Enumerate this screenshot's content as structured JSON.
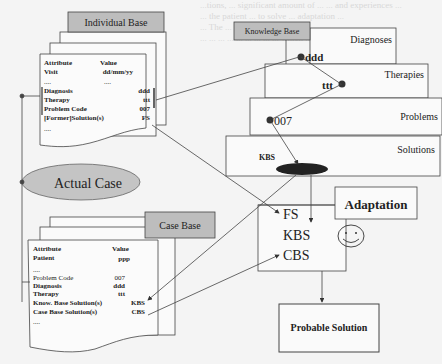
{
  "individual_base": {
    "title": "Individual Base",
    "header": {
      "attribute": "Attribute",
      "value": "Value"
    },
    "rows": [
      {
        "attribute": "Visit",
        "value": "dd/mm/yy"
      },
      {
        "attribute": "....",
        "value": "...."
      },
      {
        "attribute": "Diagnosis",
        "value": "ddd"
      },
      {
        "attribute": "Therapy",
        "value": "ttt"
      },
      {
        "attribute": "Problem Code",
        "value": "007"
      },
      {
        "attribute": "[Former]Solution(s)",
        "value": "FS"
      },
      {
        "attribute": "....",
        "value": ""
      }
    ]
  },
  "knowledge_base": {
    "title": "Knowledge Base",
    "levels": [
      "Diagnoses",
      "Therapies",
      "Problems",
      "Solutions"
    ],
    "nodes": {
      "diagnosis": "ddd",
      "therapy": "ttt",
      "problem": "007",
      "solution": "KBS"
    }
  },
  "actual_case": {
    "label": "Actual Case"
  },
  "case_base": {
    "title": "Case Base",
    "header": {
      "attribute": "Attribute",
      "value": "Value"
    },
    "rows": [
      {
        "attribute": "Patient",
        "value": "ppp"
      },
      {
        "attribute": "....",
        "value": ""
      },
      {
        "attribute": "Problem Code",
        "value": "007"
      },
      {
        "attribute": "Diagnosis",
        "value": "ddd"
      },
      {
        "attribute": "Therapy",
        "value": "ttt"
      },
      {
        "attribute": "Know. Base Solution(s)",
        "value": "KBS"
      },
      {
        "attribute": "Case Base Solution(s)",
        "value": "CBS"
      },
      {
        "attribute": "....",
        "value": ""
      }
    ]
  },
  "solutions_box": {
    "items": [
      "FS",
      "KBS",
      "CBS"
    ]
  },
  "adaptation": {
    "label": "Adaptation",
    "icon": "smiley-face-icon"
  },
  "probable_solution": {
    "label": "Probable Solution"
  },
  "background_text": [
    "...tions, ... significant amount of ... ... and experiences ...",
    "... the patient ... to solve ... adaptation ...",
    "... The ... ... ... ... ... ... ... ... ... ... ... ...",
    "... ... ... ... ... ... ... ... ... which ... ... ... ..."
  ]
}
